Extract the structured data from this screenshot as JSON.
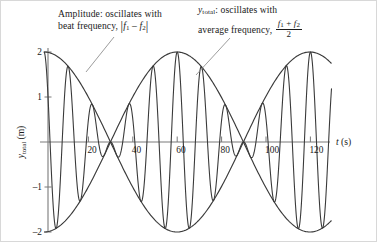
{
  "chart_data": {
    "type": "line",
    "title": "",
    "xlabel": "t (s)",
    "ylabel": "y_total (m)",
    "xlim": [
      -2,
      132
    ],
    "ylim": [
      -2.35,
      2.35
    ],
    "xticks": [
      20,
      40,
      60,
      80,
      100,
      120
    ],
    "yticks": [
      2,
      1,
      -1,
      -2
    ],
    "grid": false,
    "legend_position": "none",
    "series": [
      {
        "name": "y_total",
        "description": "sum of two sinusoids producing beats",
        "amplitude_each": 1,
        "f1": 0.1,
        "f2": 0.0833,
        "average_frequency": 0.09165,
        "beat_frequency": 0.01667,
        "beat_period": 60,
        "max_amplitude": 2,
        "nodes_at": [
          30,
          90
        ],
        "antinodes_at": [
          0,
          60,
          120
        ]
      },
      {
        "name": "envelope_upper",
        "description": "2*|cos(pi*(f1-f2)*t)|, sign-carrying cosine envelope",
        "values_at_t": [
          [
            0,
            2
          ],
          [
            15,
            1.41
          ],
          [
            30,
            0
          ],
          [
            45,
            -1.41
          ],
          [
            60,
            -2
          ],
          [
            75,
            -1.41
          ],
          [
            90,
            0
          ],
          [
            105,
            1.41
          ],
          [
            120,
            2
          ]
        ]
      },
      {
        "name": "envelope_lower",
        "description": "mirror of upper envelope about t axis",
        "values_at_t": [
          [
            0,
            -2
          ],
          [
            15,
            -1.41
          ],
          [
            30,
            0
          ],
          [
            45,
            1.41
          ],
          [
            60,
            2
          ],
          [
            75,
            1.41
          ],
          [
            90,
            0
          ],
          [
            105,
            -1.41
          ],
          [
            120,
            -2
          ]
        ]
      }
    ],
    "annotations": [
      {
        "id": "amplitude-note",
        "text": "Amplitude: oscillates with beat frequency, |f1 - f2|",
        "points_to": "envelope curve"
      },
      {
        "id": "ytotal-note",
        "text": "y_total: oscillates with average frequency, (f1 + f2)/2",
        "points_to": "fast oscillation near t = 62 s"
      }
    ]
  },
  "annotations": {
    "left": {
      "line1": "Amplitude: oscillates with",
      "line2_pre": "beat frequency, ",
      "f1": "f",
      "sub1": "1",
      "minus": " – ",
      "f2": "f",
      "sub2": "2"
    },
    "right": {
      "y": "y",
      "y_sub": "total",
      "line1_rest": ": oscillates with",
      "line2_pre": "average frequency, ",
      "frac_num_f1": "f",
      "frac_num_sub1": "1",
      "frac_plus": " + ",
      "frac_num_f2": "f",
      "frac_num_sub2": "2",
      "frac_den": "2"
    }
  },
  "axes": {
    "x_label_italic": "t",
    "x_label_unit": " (s)",
    "y_label_main": "y",
    "y_label_sub": "total",
    "y_label_unit": " (m)",
    "x_ticks": [
      "20",
      "40",
      "60",
      "80",
      "100",
      "120"
    ],
    "y_ticks": [
      "2",
      "1",
      "–1",
      "–2"
    ]
  },
  "colors": {
    "curve": "#3a3a3a",
    "envelope": "#3a3a3a",
    "axis": "#7a7a7a",
    "text": "#1a1a1a",
    "frame": "#d8d8d8",
    "leader": "#8a8a8a",
    "background": "#ffffff"
  }
}
